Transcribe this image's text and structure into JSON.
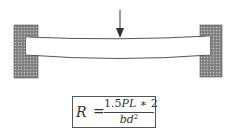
{
  "diagram": {
    "elements": {
      "left_support": {
        "type": "fixed-wall",
        "x": 14,
        "y": 25,
        "width": 24,
        "height": 53
      },
      "right_support": {
        "type": "fixed-wall",
        "x": 200,
        "y": 25,
        "width": 22,
        "height": 52
      },
      "beam": {
        "type": "deflected-beam",
        "x_start": 26,
        "x_end": 210,
        "top_y_end": 37,
        "top_y_mid": 39,
        "bottom_y_end": 55,
        "bottom_y_mid": 59
      },
      "load_arrow": {
        "type": "point-load",
        "x": 120,
        "y_start": 10,
        "y_end": 38,
        "direction": "down"
      }
    },
    "colors": {
      "wall_fill": "#7a7a7a",
      "wall_hatch": "#b5b5b5",
      "beam_stroke": "#555555",
      "beam_fill": "#ffffff",
      "arrow": "#333333"
    }
  },
  "formula": {
    "lhs": "R",
    "equals": "=",
    "numerator_coef": "1.5",
    "numerator_vars": "PL",
    "numerator_op": " ∗ 2",
    "denominator_vars": "bd",
    "denominator_exp": "2",
    "full_text": "R = 1.5PL ∗ 2 / bd²"
  }
}
